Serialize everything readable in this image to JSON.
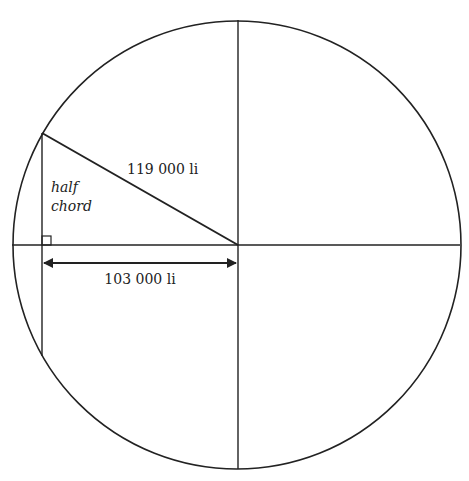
{
  "diagram": {
    "type": "geometry",
    "circle": {
      "cx": 237,
      "cy": 245,
      "r": 224
    },
    "colors": {
      "stroke": "#222222",
      "background": "#ffffff"
    },
    "labels": {
      "hypotenuse": "119 000 li",
      "half_chord_line1": "half",
      "half_chord_line2": "chord",
      "base_distance": "103 000 li"
    }
  }
}
